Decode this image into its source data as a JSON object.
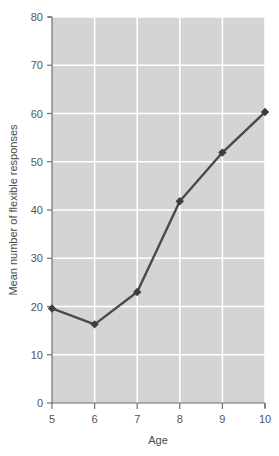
{
  "chart_data": {
    "type": "line",
    "title": "",
    "subtitle": "",
    "xlabel": "Age",
    "ylabel": "Mean number of flexible responses",
    "x": [
      5,
      6,
      7,
      8,
      9,
      10
    ],
    "categories": [
      "5",
      "6",
      "7",
      "8",
      "9",
      "10"
    ],
    "values": [
      19.6,
      16.3,
      23.0,
      41.8,
      51.9,
      60.3
    ],
    "series": [
      {
        "name": "Mean number of flexible responses",
        "values": [
          19.6,
          16.3,
          23.0,
          41.8,
          51.9,
          60.3
        ]
      }
    ],
    "xlim": [
      5,
      10
    ],
    "ylim": [
      0,
      80
    ],
    "xticks": [
      5,
      6,
      7,
      8,
      9,
      10
    ],
    "yticks": [
      0,
      10,
      20,
      30,
      40,
      50,
      60,
      70,
      80
    ],
    "xtick_labels": [
      "5",
      "6",
      "7",
      "8",
      "9",
      "10"
    ],
    "ytick_labels": [
      "0",
      "10",
      "20",
      "30",
      "40",
      "50",
      "60",
      "70",
      "80"
    ],
    "grid": true,
    "grid_axes": "both",
    "legend": false,
    "legend_position": "none",
    "marker": "diamond",
    "annotations": []
  },
  "style": {
    "plot_background": "#d4d4d4",
    "grid_color": "#ffffff",
    "line_color": "#4a4a4a",
    "marker_color": "#3d3d3d",
    "axis_color": "#6f6f6f",
    "text_color": "#555555",
    "page_background": "#ffffff"
  },
  "axis_titles": {
    "x": "Age",
    "y": "Mean number of flexible responses"
  },
  "y_ticks": {
    "t0": "0",
    "t1": "10",
    "t2": "20",
    "t3": "30",
    "t4": "40",
    "t5": "50",
    "t6": "60",
    "t7": "70",
    "t8": "80"
  },
  "x_ticks": {
    "t0": "5",
    "t1": "6",
    "t2": "7",
    "t3": "8",
    "t4": "9",
    "t5": "10"
  }
}
